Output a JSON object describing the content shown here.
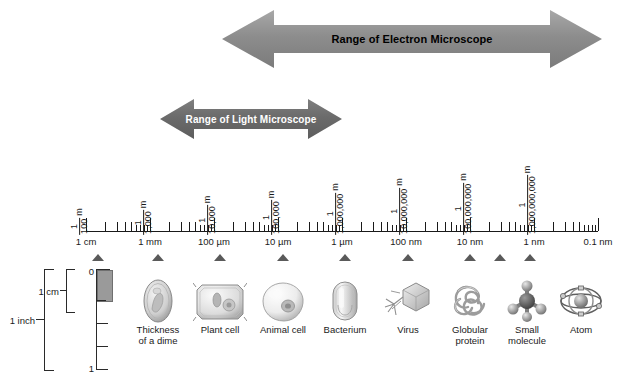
{
  "figure": {
    "ranges": [
      {
        "id": "electron",
        "label": "Range of Electron Microscope"
      },
      {
        "id": "light",
        "label": "Range of Light Microscope"
      }
    ],
    "scale": {
      "fractions": [
        {
          "numerator": "1",
          "denominator": "100",
          "unit": "m"
        },
        {
          "numerator": "1",
          "denominator": "1,000",
          "unit": "m"
        },
        {
          "numerator": "1",
          "denominator": "10,000",
          "unit": "m"
        },
        {
          "numerator": "1",
          "denominator": "100,000",
          "unit": "m"
        },
        {
          "numerator": "1",
          "denominator": "1,000,000",
          "unit": "m"
        },
        {
          "numerator": "1",
          "denominator": "10,000,000",
          "unit": "m"
        },
        {
          "numerator": "1",
          "denominator": "100,000,000",
          "unit": "m"
        },
        {
          "numerator": "1",
          "denominator": "1,000,000,000",
          "unit": "m"
        }
      ],
      "units": [
        "1 cm",
        "1 mm",
        "100 µm",
        "10 µm",
        "1 µm",
        "100 nm",
        "10 nm",
        "1 nm",
        "0.1 nm"
      ]
    },
    "ruler": {
      "top_number": "0",
      "bottom_number": "1",
      "cm_label": "1 cm",
      "inch_label": "1 inch"
    },
    "specimens": [
      {
        "id": "dime",
        "label": "Thickness\nof a dime"
      },
      {
        "id": "plant-cell",
        "label": "Plant cell"
      },
      {
        "id": "animal-cell",
        "label": "Animal cell"
      },
      {
        "id": "bacterium",
        "label": "Bacterium"
      },
      {
        "id": "virus",
        "label": "Virus"
      },
      {
        "id": "globular-protein",
        "label": "Globular\nprotein"
      },
      {
        "id": "small-molecule",
        "label": "Small\nmolecule"
      },
      {
        "id": "atom",
        "label": "Atom"
      }
    ],
    "colors": {
      "electron_arrow": "#8d8d8d",
      "light_arrow": "#6b6b6b",
      "marker": "#5a5a5a",
      "line": "#1a1a1a",
      "ruler_block": "#9a9a9a"
    }
  }
}
